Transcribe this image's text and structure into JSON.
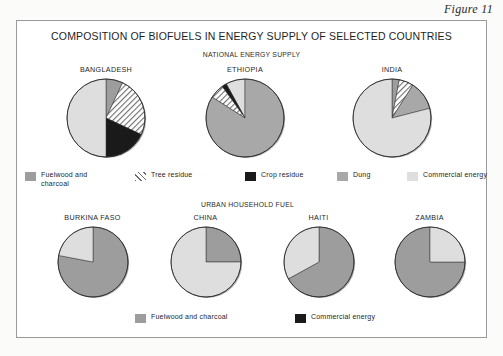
{
  "figure_label": "Figure 11",
  "title": "COMPOSITION OF BIOFUELS IN ENERGY SUPPLY OF SELECTED COUNTRIES",
  "sections": {
    "national": "NATIONAL ENERGY SUPPLY",
    "urban": "URBAN HOUSEHOLD FUEL"
  },
  "colors": {
    "fuelwood": "#9d9d9d",
    "dung": "#a8a8a8",
    "crop_residue": "#1a1a1a",
    "commercial": "#dedede",
    "tree_residue": "#ffffff",
    "outline": "#2e2e2e"
  },
  "national_legend": [
    {
      "label": "Fuelwood and\ncharcoal",
      "swatch": "fuelwood"
    },
    {
      "label": "Tree residue",
      "swatch": "tree"
    },
    {
      "label": "Crop residue",
      "swatch": "crop"
    },
    {
      "label": "Dung",
      "swatch": "dung"
    },
    {
      "label": "Commercial energy",
      "swatch": "commercial"
    }
  ],
  "urban_legend": [
    {
      "label": "Fuelwood and charcoal",
      "swatch": "fuelwood"
    },
    {
      "label": "Commercial energy",
      "swatch": "crop"
    }
  ],
  "captions": {
    "bangladesh": "BANGLADESH",
    "ethiopia": "ETHIOPIA",
    "india": "INDIA",
    "burkina_faso": "BURKINA FASO",
    "china": "CHINA",
    "haiti": "HAITI",
    "zambia": "ZAMBIA"
  },
  "chart_data": [
    {
      "type": "pie",
      "title": "BANGLADESH",
      "group": "NATIONAL ENERGY SUPPLY",
      "labels": [
        "Fuelwood and charcoal",
        "Tree residue",
        "Crop residue",
        "Commercial energy"
      ],
      "values": [
        7,
        25,
        18,
        50
      ],
      "units": "percent",
      "start_angle_deg": 0,
      "direction": "clockwise"
    },
    {
      "type": "pie",
      "title": "ETHIOPIA",
      "group": "NATIONAL ENERGY SUPPLY",
      "labels": [
        "Commercial energy",
        "Crop residue",
        "Tree residue",
        "Dung"
      ],
      "values": [
        8,
        2,
        6,
        84
      ],
      "units": "percent",
      "start_angle_deg": 0,
      "direction": "counter-clockwise"
    },
    {
      "type": "pie",
      "title": "INDIA",
      "group": "NATIONAL ENERGY SUPPLY",
      "labels": [
        "Fuelwood and charcoal",
        "Tree residue",
        "Dung",
        "Commercial energy"
      ],
      "values": [
        3,
        6,
        12,
        79
      ],
      "units": "percent",
      "start_angle_deg": 0,
      "direction": "clockwise"
    },
    {
      "type": "pie",
      "title": "BURKINA FASO",
      "group": "URBAN HOUSEHOLD FUEL",
      "labels": [
        "Fuelwood and charcoal",
        "Commercial energy"
      ],
      "values": [
        78,
        22
      ],
      "units": "percent",
      "start_angle_deg": 0,
      "direction": "clockwise"
    },
    {
      "type": "pie",
      "title": "CHINA",
      "group": "URBAN HOUSEHOLD FUEL",
      "labels": [
        "Fuelwood and charcoal",
        "Commercial energy"
      ],
      "values": [
        25,
        75
      ],
      "units": "percent",
      "start_angle_deg": 0,
      "direction": "clockwise"
    },
    {
      "type": "pie",
      "title": "HAITI",
      "group": "URBAN HOUSEHOLD FUEL",
      "labels": [
        "Fuelwood and charcoal",
        "Commercial energy"
      ],
      "values": [
        67,
        33
      ],
      "units": "percent",
      "start_angle_deg": 0,
      "direction": "clockwise"
    },
    {
      "type": "pie",
      "title": "ZAMBIA",
      "group": "URBAN HOUSEHOLD FUEL",
      "labels": [
        "Fuelwood and charcoal",
        "Commercial energy"
      ],
      "values": [
        75,
        25
      ],
      "units": "percent",
      "start_angle_deg": 0,
      "direction": "counter-clockwise"
    }
  ]
}
